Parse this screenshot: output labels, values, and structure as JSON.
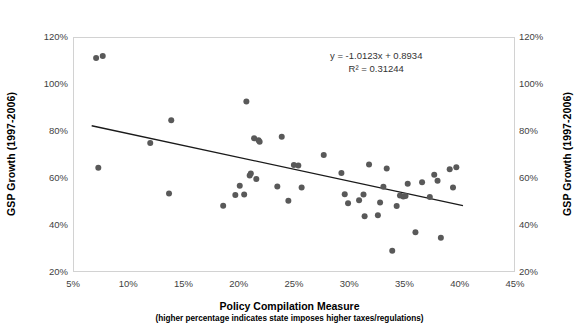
{
  "chart_data": {
    "type": "scatter",
    "title": "",
    "xlabel": "Policy Compilation Measure",
    "xlabel_sub": "(higher percentage indicates state imposes higher taxes/regulations)",
    "ylabel": "GSP Growth (1997-2006)",
    "ylabel_right": "GSP Growth (1997-2006)",
    "xlim": [
      5,
      45
    ],
    "ylim": [
      20,
      120
    ],
    "x_tick_labels": [
      "5%",
      "10%",
      "15%",
      "20%",
      "25%",
      "30%",
      "35%",
      "40%",
      "45%"
    ],
    "x_tick_values": [
      5,
      10,
      15,
      20,
      25,
      30,
      35,
      40,
      45
    ],
    "y_tick_labels": [
      "120%",
      "100%",
      "80%",
      "60%",
      "40%",
      "20%"
    ],
    "y_tick_values": [
      120,
      100,
      80,
      60,
      40,
      20
    ],
    "grid": false,
    "legend": null,
    "marker_color": "#595959",
    "marker_size": 3.0,
    "trendline": {
      "equation_label": "y = -1.0123x + 0.8934",
      "r2_label": "R² = 0.31244",
      "slope": -1.0123,
      "intercept": 0.8934,
      "r2": 0.31244,
      "color": "#1a1a1a",
      "width": 1.3,
      "x_start": 6.6,
      "x_end": 40.2
    },
    "points": [
      {
        "x": 7.0,
        "y": 111.5
      },
      {
        "x": 7.6,
        "y": 112.3
      },
      {
        "x": 7.2,
        "y": 64.8
      },
      {
        "x": 11.9,
        "y": 75.3
      },
      {
        "x": 13.8,
        "y": 85.0
      },
      {
        "x": 13.6,
        "y": 53.8
      },
      {
        "x": 18.5,
        "y": 48.6
      },
      {
        "x": 19.6,
        "y": 53.2
      },
      {
        "x": 20.0,
        "y": 57.1
      },
      {
        "x": 20.4,
        "y": 53.4
      },
      {
        "x": 20.6,
        "y": 93.0
      },
      {
        "x": 20.9,
        "y": 61.5
      },
      {
        "x": 21.0,
        "y": 62.3
      },
      {
        "x": 21.3,
        "y": 77.3
      },
      {
        "x": 21.7,
        "y": 76.5
      },
      {
        "x": 21.8,
        "y": 75.8
      },
      {
        "x": 21.5,
        "y": 60.0
      },
      {
        "x": 23.4,
        "y": 56.8
      },
      {
        "x": 23.8,
        "y": 78.0
      },
      {
        "x": 24.4,
        "y": 50.7
      },
      {
        "x": 24.9,
        "y": 66.0
      },
      {
        "x": 25.3,
        "y": 65.7
      },
      {
        "x": 25.6,
        "y": 56.4
      },
      {
        "x": 27.6,
        "y": 70.2
      },
      {
        "x": 29.2,
        "y": 62.6
      },
      {
        "x": 29.5,
        "y": 53.5
      },
      {
        "x": 29.8,
        "y": 49.7
      },
      {
        "x": 30.8,
        "y": 51.0
      },
      {
        "x": 31.2,
        "y": 53.4
      },
      {
        "x": 31.3,
        "y": 44.2
      },
      {
        "x": 31.7,
        "y": 66.2
      },
      {
        "x": 32.5,
        "y": 44.6
      },
      {
        "x": 32.7,
        "y": 50.0
      },
      {
        "x": 33.0,
        "y": 56.7
      },
      {
        "x": 33.3,
        "y": 64.5
      },
      {
        "x": 33.8,
        "y": 29.5
      },
      {
        "x": 34.2,
        "y": 48.5
      },
      {
        "x": 34.5,
        "y": 53.0
      },
      {
        "x": 34.8,
        "y": 52.6
      },
      {
        "x": 35.0,
        "y": 52.8
      },
      {
        "x": 35.2,
        "y": 58.0
      },
      {
        "x": 35.9,
        "y": 37.3
      },
      {
        "x": 36.5,
        "y": 58.6
      },
      {
        "x": 37.2,
        "y": 52.3
      },
      {
        "x": 37.6,
        "y": 61.8
      },
      {
        "x": 37.9,
        "y": 59.3
      },
      {
        "x": 38.2,
        "y": 35.0
      },
      {
        "x": 39.0,
        "y": 64.2
      },
      {
        "x": 39.3,
        "y": 56.4
      },
      {
        "x": 39.6,
        "y": 65.0
      }
    ]
  },
  "annotation": {
    "line1": "y = -1.0123x + 0.8934",
    "line2": "R² = 0.31244"
  }
}
